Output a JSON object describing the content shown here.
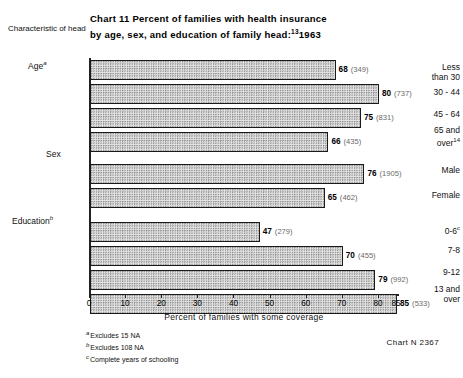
{
  "header": {
    "axis_corner_label": "Characteristic of head",
    "title_line1": "Chart 11   Percent of families with health insurance",
    "title_line2_pre": "by age, sex, and education of family head:",
    "title_superscript": "13",
    "title_year": "1963"
  },
  "groups": [
    {
      "label": "Age",
      "marker": "a"
    },
    {
      "label": "Sex",
      "marker": ""
    },
    {
      "label": "Education",
      "marker": "b"
    }
  ],
  "xaxis": {
    "title": "Percent of families with some coverage",
    "ticks": [
      "0",
      "10",
      "20",
      "30",
      "40",
      "50",
      "60",
      "70",
      "80",
      "85"
    ],
    "min": 0,
    "max": 85
  },
  "footnotes": [
    {
      "marker": "a",
      "text": "Excludes 15 NA"
    },
    {
      "marker": "b",
      "text": "Excludes 108 NA"
    },
    {
      "marker": "c",
      "text": "Complete years of schooling"
    }
  ],
  "chart_number": "Chart N  2367",
  "chart_data": {
    "type": "bar",
    "orientation": "horizontal",
    "xlabel": "Percent of families with some coverage",
    "ylabel": "Characteristic of head",
    "xlim": [
      0,
      85
    ],
    "grid": false,
    "legend": "none",
    "groups": [
      "Age",
      "Sex",
      "Education"
    ],
    "categories": [
      "Less than 30",
      "30 - 44",
      "45 - 64",
      "65 and over",
      "Male",
      "Female",
      "0-6",
      "7-8",
      "9-12",
      "13 and over"
    ],
    "values": [
      68,
      80,
      75,
      66,
      76,
      65,
      47,
      70,
      79,
      85
    ],
    "counts": [
      349,
      737,
      831,
      435,
      1905,
      462,
      279,
      455,
      992,
      533
    ],
    "value_labels": [
      "68 (349)",
      "80 (737)",
      "75 (831)",
      "66 (435)",
      "76 (1905)",
      "65 (462)",
      "47 (279)",
      "70 (455)",
      "79 (992)",
      "85 (533)"
    ]
  },
  "bars": [
    {
      "group": "Age",
      "label_line1": "Less",
      "label_line2": "than  30",
      "sup": "",
      "sup2": "",
      "value": 68,
      "count": "(349)",
      "pct": "68"
    },
    {
      "group": "Age",
      "label_line1": "30 - 44",
      "label_line2": "",
      "sup": "",
      "sup2": "",
      "value": 80,
      "count": "(737)",
      "pct": "80"
    },
    {
      "group": "Age",
      "label_line1": "45 - 64",
      "label_line2": "",
      "sup": "",
      "sup2": "",
      "value": 75,
      "count": "(831)",
      "pct": "75"
    },
    {
      "group": "Age",
      "label_line1": "65 and",
      "label_line2": "over",
      "sup": "",
      "sup2": "14",
      "value": 66,
      "count": "(435)",
      "pct": "66"
    },
    {
      "group": "Sex",
      "label_line1": "Male",
      "label_line2": "",
      "sup": "",
      "sup2": "",
      "value": 76,
      "count": "(1905)",
      "pct": "76"
    },
    {
      "group": "Sex",
      "label_line1": "Female",
      "label_line2": "",
      "sup": "",
      "sup2": "",
      "value": 65,
      "count": "(462)",
      "pct": "65"
    },
    {
      "group": "Education",
      "label_line1": "0-6",
      "label_line2": "",
      "sup": "c",
      "sup2": "",
      "value": 47,
      "count": "(279)",
      "pct": "47"
    },
    {
      "group": "Education",
      "label_line1": "7-8",
      "label_line2": "",
      "sup": "",
      "sup2": "",
      "value": 70,
      "count": "(455)",
      "pct": "70"
    },
    {
      "group": "Education",
      "label_line1": "9-12",
      "label_line2": "",
      "sup": "",
      "sup2": "",
      "value": 79,
      "count": "(992)",
      "pct": "79"
    },
    {
      "group": "Education",
      "label_line1": "13 and",
      "label_line2": "over",
      "sup": "",
      "sup2": "",
      "value": 85,
      "count": "(533)",
      "pct": "85"
    }
  ]
}
